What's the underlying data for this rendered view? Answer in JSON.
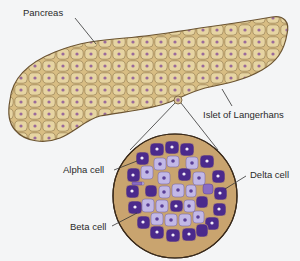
{
  "diagram": {
    "labels": {
      "pancreas": "Pancreas",
      "islet": "Islet of Langerhans",
      "alpha": "Alpha cell",
      "delta": "Delta cell",
      "beta": "Beta cell"
    },
    "colors": {
      "background": "#f4f5f6",
      "pancreas_fill": "#c9a66b",
      "pancreas_cell": "#e3cf9a",
      "pancreas_outline": "#6b5432",
      "nucleus": "#9a6a9a",
      "islet_matrix": "#c9a46f",
      "beta_cell": "#4b2a8c",
      "alpha_cell": "#b9aee0",
      "delta_cell": "#7a5cb8",
      "leader_line": "#333333"
    }
  }
}
